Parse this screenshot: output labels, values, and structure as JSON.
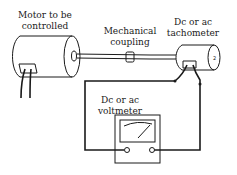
{
  "diagram": {
    "labels": {
      "motor": [
        "Motor to be",
        "controlled"
      ],
      "coupling": [
        "Mechanical",
        "coupling"
      ],
      "tachometer": [
        "Dc or ac",
        "tachometer"
      ],
      "voltmeter": [
        "Dc or ac",
        "voltmeter"
      ]
    },
    "components": [
      "motor",
      "shaft",
      "mechanical-coupling",
      "tachometer",
      "voltmeter",
      "wires"
    ],
    "colors": {
      "line": "#1a1a1a",
      "background": "#ffffff"
    }
  }
}
